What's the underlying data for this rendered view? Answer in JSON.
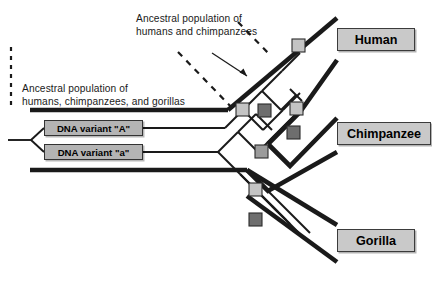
{
  "diagram": {
    "annotations": {
      "ancestral_hc_line1": "Ancestral population of",
      "ancestral_hc_line2": "humans and chimpanzees",
      "ancestral_hcg_line1": "Ancestral population of",
      "ancestral_hcg_line2": "humans, chimpanzees, and gorillas"
    },
    "taxa": [
      {
        "id": "human",
        "label": "Human"
      },
      {
        "id": "chimpanzee",
        "label": "Chimpanzee"
      },
      {
        "id": "gorilla",
        "label": "Gorilla"
      }
    ],
    "variants": [
      {
        "id": "variant-A",
        "label": "DNA variant \"A\""
      },
      {
        "id": "variant-a",
        "label": "DNA variant \"a\""
      }
    ],
    "colors": {
      "population_outline": "#1a1a1a",
      "gene_lineage": "#1a1a1a",
      "taxon_box_fill": "#c9c9c9",
      "variant_box_fill": "#b4b4b4",
      "marker_light": "#c4c4c4",
      "marker_mid": "#9b9b9b",
      "marker_dark": "#6e6e6e",
      "background": "#ffffff",
      "text": "#1a1a1a"
    },
    "markers": [
      {
        "id": "m1",
        "shade": "light"
      },
      {
        "id": "m2",
        "shade": "light"
      },
      {
        "id": "m3",
        "shade": "dark"
      },
      {
        "id": "m4",
        "shade": "light"
      },
      {
        "id": "m5",
        "shade": "mid"
      },
      {
        "id": "m6",
        "shade": "dark"
      },
      {
        "id": "m7",
        "shade": "light"
      },
      {
        "id": "m8",
        "shade": "mid"
      }
    ]
  }
}
